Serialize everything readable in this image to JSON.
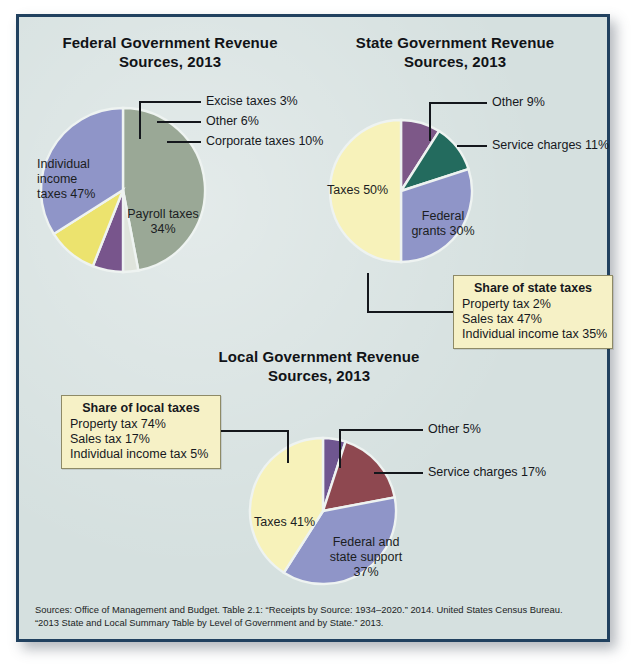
{
  "figure": {
    "background_color": "#d5e0df",
    "frame_color": "#21415f",
    "callout_fill": "#f6f1c6"
  },
  "charts": [
    {
      "id": "federal",
      "title_line1": "Federal Government Revenue",
      "title_line2": "Sources, 2013",
      "inside_labels": [
        {
          "text": "Individual\nincome\ntaxes 47%"
        },
        {
          "text": "Payroll taxes\n34%"
        }
      ],
      "leader_labels": [
        {
          "text": "Excise taxes 3%"
        },
        {
          "text": "Other 6%"
        },
        {
          "text": "Corporate taxes 10%"
        }
      ]
    },
    {
      "id": "state",
      "title_line1": "State Government Revenue",
      "title_line2": "Sources, 2013",
      "inside_labels": [
        {
          "text": "Taxes 50%"
        },
        {
          "text": "Federal\ngrants 30%"
        }
      ],
      "leader_labels": [
        {
          "text": "Other 9%"
        },
        {
          "text": "Service charges 11%"
        }
      ],
      "callout": {
        "title": "Share of state taxes",
        "rows": [
          "Property tax 2%",
          "Sales tax 47%",
          "Individual income tax 35%"
        ]
      }
    },
    {
      "id": "local",
      "title_line1": "Local Government Revenue",
      "title_line2": "Sources, 2013",
      "inside_labels": [
        {
          "text": "Taxes 41%"
        },
        {
          "text": "Federal and\nstate support\n37%"
        }
      ],
      "leader_labels": [
        {
          "text": "Other 5%"
        },
        {
          "text": "Service charges 17%"
        }
      ],
      "callout": {
        "title": "Share of local taxes",
        "rows": [
          "Property tax 74%",
          "Sales tax 17%",
          "Individual income tax 5%"
        ]
      }
    }
  ],
  "sources": {
    "line1": "Sources: Office of Management and Budget. Table 2.1: “Receipts by Source: 1934–2020.” 2014. United States Census Bureau.",
    "line2": "“2013 State and Local Summary Table by Level of Government and by State.” 2013."
  },
  "chart_data": [
    {
      "type": "pie",
      "title": "Federal Government Revenue Sources, 2013",
      "categories": [
        "Individual income taxes",
        "Excise taxes",
        "Other",
        "Corporate taxes",
        "Payroll taxes"
      ],
      "values": [
        47,
        3,
        6,
        10,
        34
      ],
      "labels": [
        "Individual income taxes 47%",
        "Excise taxes 3%",
        "Other 6%",
        "Corporate taxes 10%",
        "Payroll taxes 34%"
      ],
      "colors": [
        "#9aa896",
        "#dfe4dc",
        "#78558c",
        "#ece36e",
        "#8f95c8"
      ],
      "units": "percent",
      "start_angle_deg": 0,
      "direction": "clockwise",
      "legend": "none (direct labels and leader lines)"
    },
    {
      "type": "pie",
      "title": "State Government Revenue Sources, 2013",
      "categories": [
        "Other",
        "Service charges",
        "Federal grants",
        "Taxes"
      ],
      "values": [
        9,
        11,
        30,
        50
      ],
      "labels": [
        "Other 9%",
        "Service charges 11%",
        "Federal grants 30%",
        "Taxes 50%"
      ],
      "colors": [
        "#7d5888",
        "#236b5e",
        "#8f95c8",
        "#f7f2ba"
      ],
      "units": "percent",
      "start_angle_deg": 0,
      "direction": "clockwise",
      "legend": "none (direct labels and leader lines)",
      "annotation": {
        "title": "Share of state taxes",
        "items": [
          {
            "label": "Property tax",
            "value": 2
          },
          {
            "label": "Sales tax",
            "value": 47
          },
          {
            "label": "Individual income tax",
            "value": 35
          }
        ]
      }
    },
    {
      "type": "pie",
      "title": "Local Government Revenue Sources, 2013",
      "categories": [
        "Other",
        "Service charges",
        "Federal and state support",
        "Taxes"
      ],
      "values": [
        5,
        17,
        37,
        41
      ],
      "labels": [
        "Other 5%",
        "Service charges 17%",
        "Federal and state support 37%",
        "Taxes 41%"
      ],
      "colors": [
        "#6f5690",
        "#8e4850",
        "#8f95c8",
        "#f7f2ba"
      ],
      "units": "percent",
      "start_angle_deg": 0,
      "direction": "clockwise",
      "legend": "none (direct labels and leader lines)",
      "annotation": {
        "title": "Share of local taxes",
        "items": [
          {
            "label": "Property tax",
            "value": 74
          },
          {
            "label": "Sales tax",
            "value": 17
          },
          {
            "label": "Individual income tax",
            "value": 5
          }
        ]
      }
    }
  ]
}
